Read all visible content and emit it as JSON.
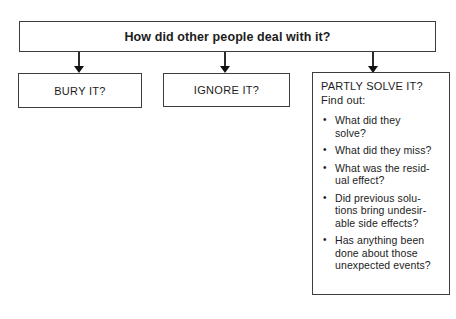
{
  "diagram": {
    "root": {
      "label": "How did other people deal with it?"
    },
    "children": [
      {
        "label": "BURY IT?"
      },
      {
        "label": "IGNORE IT?"
      }
    ],
    "partly_box": {
      "title": "PARTLY SOLVE IT?",
      "subtitle": "Find out:",
      "bullet_char": "•",
      "bullets": [
        "What did they\nsolve?",
        "What did they miss?",
        "What was the resid-\nual effect?",
        "Did previous solu-\ntions bring undesir-\nable side effects?",
        "Has anything been\ndone about those\nunexpected events?"
      ]
    },
    "colors": {
      "border": "#3d3d3d",
      "text": "#1c1c1c",
      "background": "#ffffff"
    }
  }
}
